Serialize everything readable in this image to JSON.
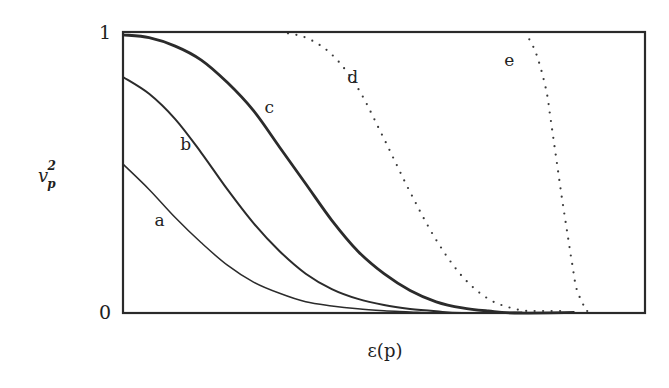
{
  "chart_data": {
    "type": "line",
    "title": "",
    "xlabel": "ε(p)",
    "ylabel": "v_p^2",
    "ylabel_main": "v",
    "ylabel_sub": "p",
    "ylabel_sup": "2",
    "xlim": [
      0,
      1
    ],
    "ylim": [
      0,
      1
    ],
    "y_ticks": [
      {
        "value": 0,
        "label": "0"
      },
      {
        "value": 1,
        "label": "1"
      }
    ],
    "x_ticks": [],
    "grid": false,
    "legend": "none (curves labeled inline)",
    "series": [
      {
        "name": "a",
        "style": "solid-thin",
        "x": [
          0.0,
          0.05,
          0.1,
          0.15,
          0.2,
          0.25,
          0.3,
          0.35,
          0.4,
          0.45,
          0.5,
          0.55,
          0.6
        ],
        "y": [
          0.53,
          0.44,
          0.34,
          0.25,
          0.17,
          0.11,
          0.07,
          0.04,
          0.025,
          0.015,
          0.008,
          0.004,
          0.0
        ]
      },
      {
        "name": "b",
        "style": "solid-medium",
        "x": [
          0.0,
          0.05,
          0.1,
          0.15,
          0.2,
          0.25,
          0.3,
          0.35,
          0.4,
          0.45,
          0.5,
          0.55,
          0.6,
          0.65
        ],
        "y": [
          0.84,
          0.78,
          0.69,
          0.57,
          0.44,
          0.32,
          0.22,
          0.14,
          0.085,
          0.05,
          0.028,
          0.014,
          0.006,
          0.0
        ]
      },
      {
        "name": "c",
        "style": "solid-thick",
        "x": [
          0.0,
          0.05,
          0.1,
          0.15,
          0.2,
          0.25,
          0.3,
          0.35,
          0.4,
          0.45,
          0.5,
          0.55,
          0.6,
          0.65,
          0.7,
          0.75
        ],
        "y": [
          0.99,
          0.98,
          0.95,
          0.9,
          0.82,
          0.72,
          0.59,
          0.46,
          0.33,
          0.22,
          0.14,
          0.08,
          0.04,
          0.018,
          0.007,
          0.0
        ]
      },
      {
        "name": "d",
        "style": "dotted",
        "x": [
          0.3,
          0.35,
          0.4,
          0.45,
          0.5,
          0.55,
          0.6,
          0.65,
          0.7,
          0.75,
          0.8,
          0.85
        ],
        "y": [
          1.0,
          0.98,
          0.92,
          0.8,
          0.62,
          0.43,
          0.26,
          0.13,
          0.05,
          0.015,
          0.003,
          0.0
        ]
      },
      {
        "name": "e",
        "style": "dotted",
        "x": [
          0.77,
          0.79,
          0.81,
          0.82,
          0.83,
          0.84,
          0.85,
          0.86,
          0.87,
          0.89
        ],
        "y": [
          1.0,
          0.93,
          0.8,
          0.68,
          0.55,
          0.42,
          0.3,
          0.18,
          0.08,
          0.0
        ]
      }
    ],
    "annotations": [
      {
        "text": "a",
        "x": 0.07,
        "y": 0.31
      },
      {
        "text": "b",
        "x": 0.12,
        "y": 0.58
      },
      {
        "text": "c",
        "x": 0.28,
        "y": 0.71
      },
      {
        "text": "d",
        "x": 0.44,
        "y": 0.82
      },
      {
        "text": "e",
        "x": 0.74,
        "y": 0.88
      }
    ]
  }
}
